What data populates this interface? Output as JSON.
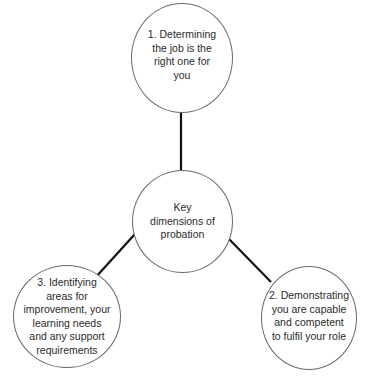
{
  "diagram": {
    "type": "hub-and-spoke",
    "center": {
      "label": "Key\ndimensions of\nprobation"
    },
    "nodes": [
      {
        "id": 1,
        "position": "top",
        "label": "1. Determining\nthe job is the\nright one for\nyou"
      },
      {
        "id": 2,
        "position": "bottom-right",
        "label": "2. Demonstrating\nyou are capable\nand competent\nto fulfil your role"
      },
      {
        "id": 3,
        "position": "bottom-left",
        "label": "3. Identifying\nareas for\nimprovement, your\nlearning needs\nand any support\nrequirements"
      }
    ],
    "edges": [
      {
        "from": "center",
        "to": 1
      },
      {
        "from": "center",
        "to": 2
      },
      {
        "from": "center",
        "to": 3
      }
    ],
    "colors": {
      "line": "#111111",
      "circle_border": "#6a6a6a",
      "text": "#2a2a2a",
      "background": "#ffffff"
    }
  }
}
